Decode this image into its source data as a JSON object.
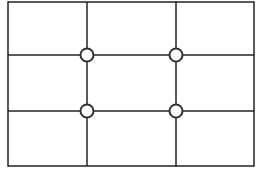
{
  "diagram": {
    "frame": {
      "x": 8,
      "y": 2,
      "width": 246,
      "height": 164
    },
    "vertical_lines": [
      87,
      176
    ],
    "horizontal_lines": [
      55,
      111
    ],
    "intersections": [
      {
        "x": 87,
        "y": 55
      },
      {
        "x": 176,
        "y": 55
      },
      {
        "x": 87,
        "y": 111
      },
      {
        "x": 176,
        "y": 111
      }
    ],
    "colors": {
      "stroke": "#222222",
      "fill": "#ffffff"
    }
  }
}
